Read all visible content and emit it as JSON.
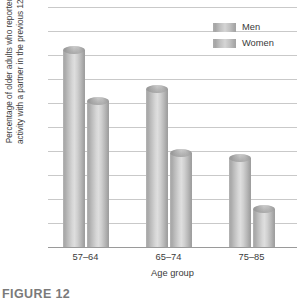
{
  "chart_data": {
    "type": "bar",
    "title": "",
    "xlabel": "Age group",
    "ylabel_line1": "Percentage of older adults who reported sexual",
    "ylabel_line2": "activity with a partner in the previous 12 months",
    "categories": [
      "57–64",
      "65–74",
      "75–85"
    ],
    "series": [
      {
        "name": "Men",
        "values": [
          82,
          66,
          37
        ]
      },
      {
        "name": "Women",
        "values": [
          61,
          39,
          16
        ]
      }
    ],
    "ylim": [
      0,
      100
    ],
    "yticks": [
      100,
      90,
      80,
      70,
      60,
      50,
      40,
      30,
      20,
      10,
      0
    ],
    "grid": true,
    "legend_position": "top-right",
    "bar_style": "cylinder",
    "colors": {
      "men_bar": "#b4b4b4",
      "women_bar": "#c8c8c8",
      "gridline": "#c9c9c9",
      "axis": "#9a9a9a",
      "text": "#3a3a3a"
    }
  },
  "caption": {
    "text": "FIGURE 12"
  }
}
